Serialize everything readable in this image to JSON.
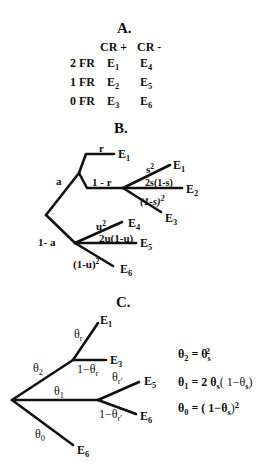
{
  "panelA": {
    "title": "A.",
    "col_headers": [
      "CR +",
      "CR -"
    ],
    "rows": [
      {
        "label": "2 FR",
        "cr_plus": "E",
        "cr_plus_sub": "1",
        "cr_minus": "E",
        "cr_minus_sub": "4"
      },
      {
        "label": "1 FR",
        "cr_plus": "E",
        "cr_plus_sub": "2",
        "cr_minus": "E",
        "cr_minus_sub": "5"
      },
      {
        "label": "0 FR",
        "cr_plus": "E",
        "cr_plus_sub": "3",
        "cr_minus": "E",
        "cr_minus_sub": "6"
      }
    ]
  },
  "panelB": {
    "title": "B.",
    "labels": {
      "a": "a",
      "one_minus_a": "1- a",
      "r": "r",
      "one_minus_r": "1 - r",
      "s2_base": "s",
      "s2_exp": "2",
      "two_s": "2s(1-s)",
      "one_minus_s2_base": "(1-s)",
      "one_minus_s2_exp": "2",
      "u2_base": "u",
      "u2_exp": "2",
      "two_u": "2u(1-u)",
      "one_minus_u2_base": "(1-u)",
      "one_minus_u2_exp": "2"
    },
    "leaves": [
      {
        "id": "E1_top",
        "text": "E",
        "sub": "1"
      },
      {
        "id": "E1",
        "text": "E",
        "sub": "1"
      },
      {
        "id": "E2",
        "text": "E",
        "sub": "2"
      },
      {
        "id": "E3",
        "text": "E",
        "sub": "3"
      },
      {
        "id": "E4",
        "text": "E",
        "sub": "4"
      },
      {
        "id": "E5",
        "text": "E",
        "sub": "5"
      },
      {
        "id": "E6",
        "text": "E",
        "sub": "6"
      }
    ]
  },
  "panelC": {
    "title": "C.",
    "labels": {
      "theta2": "θ",
      "theta2_sub": "2",
      "theta1": "θ",
      "theta1_sub": "1",
      "theta0": "θ",
      "theta0_sub": "0",
      "theta_r": "θ",
      "theta_r_sub": "r",
      "one_minus_theta_r": "1−θ",
      "one_minus_theta_r_sub": "r",
      "theta_rp": "θ",
      "theta_rp_sub": "r′",
      "one_minus_theta_rp": "1−θ",
      "one_minus_theta_rp_sub": "r′"
    },
    "leaves": [
      {
        "id": "E1",
        "text": "E",
        "sub": "1"
      },
      {
        "id": "E3",
        "text": "E",
        "sub": "3"
      },
      {
        "id": "E5",
        "text": "E",
        "sub": "5"
      },
      {
        "id": "E6a",
        "text": "E",
        "sub": "6"
      },
      {
        "id": "E6b",
        "text": "E",
        "sub": "6"
      }
    ],
    "equations": [
      {
        "lhs": "θ",
        "lhs_sub": "2",
        "rhs": "= θ",
        "rhs_sub": "s",
        "rhs_sup": "2",
        "rhs_tail": ""
      },
      {
        "lhs": "θ",
        "lhs_sub": "1",
        "rhs": "= 2 θ",
        "rhs_sub": "s",
        "rhs_sup": "",
        "rhs_tail": "( 1−θ",
        "tail_sub": "s",
        "tail_end": ")"
      },
      {
        "lhs": "θ",
        "lhs_sub": "0",
        "rhs": "= ( 1−θ",
        "rhs_sub": "s",
        "rhs_sup": "",
        "rhs_tail": ")",
        "tail_sup": "2"
      }
    ]
  }
}
